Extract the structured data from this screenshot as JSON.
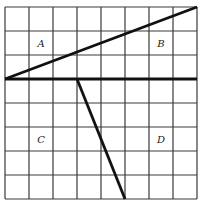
{
  "figure": {
    "grid": {
      "columns": 8,
      "rows": 8
    },
    "line_color": "#111111",
    "grid_color": "#3a3a3a",
    "segments": [
      {
        "name": "horizontal-divider",
        "from": [
          0,
          3
        ],
        "to": [
          8,
          3
        ]
      },
      {
        "name": "diagonal-line",
        "from": [
          0,
          3
        ],
        "to": [
          8,
          0
        ]
      },
      {
        "name": "slanted-line",
        "from": [
          3,
          3
        ],
        "to": [
          5,
          8
        ]
      }
    ],
    "regions": [
      {
        "label": "A",
        "cell": [
          1,
          1
        ]
      },
      {
        "label": "B",
        "cell": [
          6,
          1
        ]
      },
      {
        "label": "C",
        "cell": [
          1,
          5
        ]
      },
      {
        "label": "D",
        "cell": [
          6,
          5
        ]
      }
    ]
  }
}
